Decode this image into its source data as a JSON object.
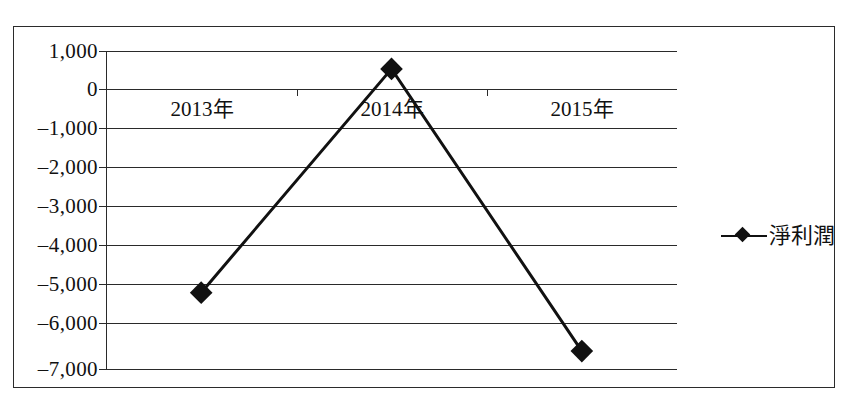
{
  "chart_data": {
    "type": "line",
    "title": "",
    "subtitle": "",
    "xlabel": "",
    "ylabel": "",
    "categories": [
      "2013年",
      "2014年",
      "2015年"
    ],
    "series": [
      {
        "name": "淨利潤",
        "values": [
          -5080,
          550,
          -6550
        ],
        "marker": "diamond",
        "color": "#111111"
      }
    ],
    "ylim": [
      -7000,
      1000
    ],
    "y_ticks": [
      1000,
      0,
      -1000,
      -2000,
      -3000,
      -4000,
      -5000,
      -6000,
      -7000
    ],
    "y_tick_labels": [
      "1,000",
      "0",
      "–1,000",
      "–2,000",
      "–3,000",
      "–4,000",
      "–5,000",
      "–6,000",
      "–7,000"
    ],
    "grid": true,
    "grid_axis": "y",
    "legend": {
      "position": "right",
      "entries": [
        {
          "label": "淨利潤",
          "marker": "diamond-line-icon"
        }
      ]
    },
    "frame": true,
    "plot_border": "left-only"
  },
  "legend": {
    "label": "淨利潤"
  }
}
